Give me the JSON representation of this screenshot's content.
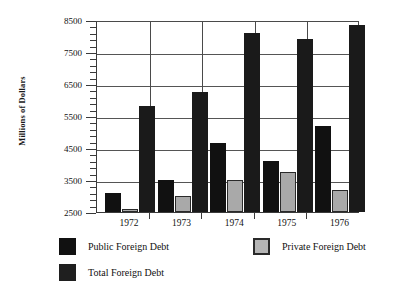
{
  "top_caption": "",
  "chart_data": {
    "type": "bar",
    "title": "",
    "xlabel": "",
    "ylabel": "Millions of Dollars",
    "categories": [
      "1972",
      "1973",
      "1974",
      "1975",
      "1976"
    ],
    "series": [
      {
        "name": "Public Foreign Debt",
        "color": "#111111",
        "values": [
          3100,
          3500,
          4650,
          4100,
          5200
        ]
      },
      {
        "name": "Private Foreign Debt",
        "color": "#a9a9a9",
        "values": [
          2600,
          3000,
          3500,
          3750,
          3200
        ]
      },
      {
        "name": "Total Foreign Debt",
        "color": "#1a1a1a",
        "values": [
          5800,
          6250,
          8100,
          7900,
          8350
        ]
      }
    ],
    "ylim": [
      2500,
      8500
    ],
    "ytick_labels": [
      "2500",
      "3500",
      "4500",
      "5500",
      "6500",
      "7500",
      "8500"
    ],
    "ytick_values": [
      2500,
      3500,
      4500,
      5500,
      6500,
      7500,
      8500
    ],
    "minor_tick_step": 200,
    "grid": true,
    "legend_position": "below",
    "legend": [
      {
        "label": "Public Foreign Debt",
        "swatch": "dark"
      },
      {
        "label": "Private Foreign Debt",
        "swatch": "gray"
      },
      {
        "label": "Total Foreign Debt",
        "swatch": "total"
      }
    ]
  }
}
